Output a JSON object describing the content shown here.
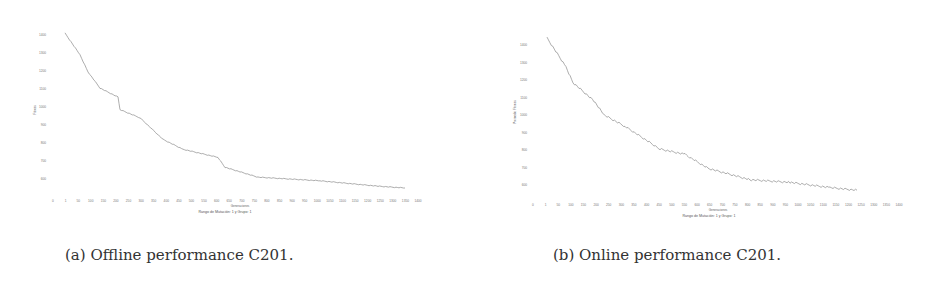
{
  "chart_data": [
    {
      "type": "line",
      "title": "",
      "caption": "(a) Offline performance C201.",
      "xlabel": "Generaciones",
      "ylabel": "Fitness",
      "legend": "Rango de Mutación: 1 y Grupo: 1",
      "yticks": [
        1400,
        1300,
        1200,
        1100,
        1000,
        900,
        800,
        700,
        600
      ],
      "xticks": [
        0,
        1,
        50,
        100,
        150,
        200,
        250,
        300,
        350,
        400,
        450,
        500,
        550,
        600,
        650,
        700,
        750,
        800,
        850,
        900,
        950,
        1000,
        1050,
        1100,
        1150,
        1200,
        1250,
        1300,
        1350,
        1400
      ],
      "ylim": [
        550,
        1420
      ],
      "grid": false,
      "series": [
        {
          "name": "Offline performance",
          "x": [
            1,
            60,
            100,
            160,
            250,
            260,
            330,
            420,
            490,
            620,
            650,
            760,
            1000,
            1240,
            1350
          ],
          "values": [
            1410,
            1290,
            1195,
            1105,
            1055,
            985,
            940,
            820,
            765,
            720,
            665,
            610,
            590,
            560,
            550
          ]
        }
      ],
      "legend_position": "bottom"
    },
    {
      "type": "line",
      "title": "",
      "caption": "(b) Online performance C201.",
      "xlabel": "Generaciones",
      "ylabel": "Promedio Fitness",
      "legend": "Rango de Mutación: 1 y Grupo: 1",
      "yticks": [
        1400,
        1300,
        1200,
        1100,
        1000,
        900,
        800,
        700,
        600
      ],
      "xticks": [
        0,
        1,
        50,
        100,
        150,
        200,
        250,
        300,
        350,
        400,
        450,
        500,
        550,
        600,
        650,
        700,
        750,
        800,
        850,
        900,
        950,
        1000,
        1050,
        1100,
        1150,
        1200,
        1250,
        1300,
        1350,
        1400
      ],
      "ylim": [
        550,
        1440
      ],
      "grid": false,
      "series": [
        {
          "name": "Online performance",
          "x": [
            1,
            80,
            110,
            200,
            240,
            330,
            470,
            580,
            670,
            850,
            1020,
            1190,
            1300
          ],
          "values": [
            1440,
            1275,
            1185,
            1080,
            1000,
            935,
            805,
            775,
            695,
            630,
            615,
            585,
            570
          ]
        }
      ],
      "legend_position": "bottom"
    }
  ],
  "captions": {
    "a": "(a) Offline performance C201.",
    "b": "(b) Online performance C201."
  },
  "colors": {
    "line": "#8a8a8a",
    "text": "#333333"
  }
}
